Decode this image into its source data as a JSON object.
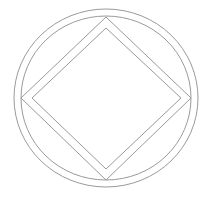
{
  "symbol": {
    "name": "circle-diamond-emblem",
    "stroke_color": "#9a9a9a",
    "background": "#ffffff",
    "center": [
      106,
      98
    ],
    "outer_circle": {
      "rx": 92,
      "ry": 89
    },
    "inner_circle": {
      "rx": 85,
      "ry": 82
    },
    "outer_diamond": {
      "top": [
        106,
        17
      ],
      "right": [
        191,
        98
      ],
      "bottom": [
        106,
        180
      ],
      "left": [
        21,
        98
      ]
    },
    "inner_diamond": {
      "top": [
        106,
        28
      ],
      "right": [
        181,
        98
      ],
      "bottom": [
        106,
        169
      ],
      "left": [
        32,
        98
      ]
    }
  }
}
